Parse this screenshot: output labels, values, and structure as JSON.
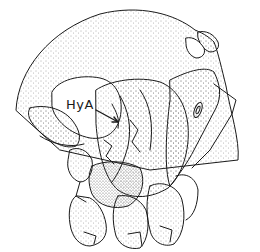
{
  "figure": {
    "line_color": "#1a1a1a",
    "stipple_color": "#555555",
    "background": "#ffffff"
  },
  "annotations": [
    {
      "text": "HyA",
      "x": 68,
      "y": 106,
      "arrow_to": [
        112,
        124
      ]
    }
  ]
}
